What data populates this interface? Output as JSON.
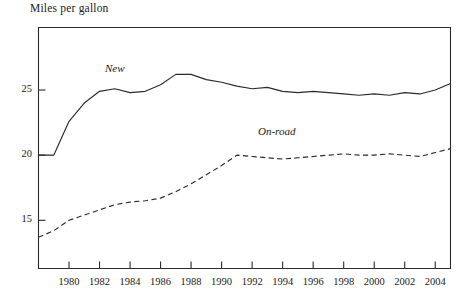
{
  "chart_data": {
    "type": "line",
    "title": "Miles per gallon",
    "xlabel": "",
    "ylabel": "Miles per gallon",
    "grid": false,
    "legend_position": "inline-annotation",
    "xlim": [
      1978,
      2005
    ],
    "ylim": [
      11.3,
      29.8
    ],
    "yticks": [
      15,
      20,
      25
    ],
    "ytick_labels": [
      "15",
      "20",
      "25"
    ],
    "xticks": [
      1980,
      1982,
      1984,
      1986,
      1988,
      1990,
      1992,
      1994,
      1996,
      1998,
      2000,
      2002,
      2004
    ],
    "xtick_labels": [
      "1980",
      "1982",
      "1984",
      "1986",
      "1988",
      "1990",
      "1992",
      "1994",
      "1996",
      "1998",
      "2000",
      "2002",
      "2004"
    ],
    "x": [
      1978,
      1979,
      1980,
      1981,
      1982,
      1983,
      1984,
      1985,
      1986,
      1987,
      1988,
      1989,
      1990,
      1991,
      1992,
      1993,
      1994,
      1995,
      1996,
      1997,
      1998,
      1999,
      2000,
      2001,
      2002,
      2003,
      2004,
      2005
    ],
    "series": [
      {
        "name": "New",
        "style": "solid",
        "label_text": "New",
        "values": [
          20.0,
          20.0,
          22.6,
          24.0,
          24.9,
          25.1,
          24.8,
          24.9,
          25.4,
          26.2,
          26.2,
          25.8,
          25.6,
          25.3,
          25.1,
          25.2,
          24.9,
          24.8,
          24.9,
          24.8,
          24.7,
          24.6,
          24.7,
          24.6,
          24.8,
          24.7,
          25.0,
          25.5
        ]
      },
      {
        "name": "On-road",
        "style": "dashed",
        "label_text": "On-road",
        "values": [
          13.7,
          14.2,
          15.0,
          15.4,
          15.8,
          16.2,
          16.4,
          16.5,
          16.7,
          17.2,
          17.8,
          18.5,
          19.2,
          20.0,
          19.9,
          19.8,
          19.7,
          19.8,
          19.9,
          20.0,
          20.1,
          20.0,
          20.0,
          20.1,
          20.0,
          19.9,
          20.2,
          20.5
        ]
      }
    ]
  }
}
